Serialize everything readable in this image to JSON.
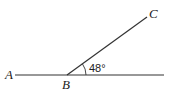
{
  "diagram": {
    "type": "angle",
    "points": {
      "A": {
        "label": "A"
      },
      "B": {
        "label": "B"
      },
      "C": {
        "label": "C"
      }
    },
    "angle": {
      "vertex": "B",
      "between": [
        "ray-BC",
        "ray-B-right"
      ],
      "label": "48°",
      "degrees": 48
    },
    "colors": {
      "line": "#333333",
      "text": "#222222",
      "background": "#ffffff"
    }
  }
}
